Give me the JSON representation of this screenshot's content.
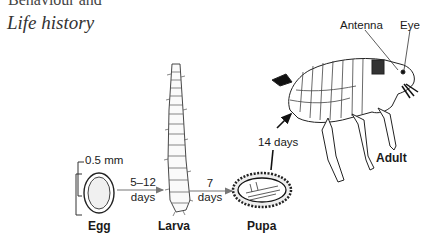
{
  "section_heading_partial": "Behaviour and",
  "title": "Life history",
  "stages": {
    "egg": "Egg",
    "larva": "Larva",
    "pupa": "Pupa",
    "adult": "Adult"
  },
  "scale": "0.5 mm",
  "durations": {
    "egg_to_larva_top": "5–12",
    "egg_to_larva_bottom": "days",
    "larva_to_pupa_top": "7",
    "larva_to_pupa_bottom": "days",
    "pupa_to_adult": "14 days"
  },
  "annotations": {
    "antenna": "Antenna",
    "eye": "Eye"
  }
}
